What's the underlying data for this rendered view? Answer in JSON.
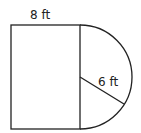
{
  "figure": {
    "labels": {
      "top_width": "8 ft",
      "radius": "6 ft"
    },
    "shapes": {
      "rectangle": {
        "x": 11,
        "y": 25,
        "width": 69,
        "height": 104
      },
      "semicircle": {
        "center": [
          80,
          77
        ],
        "radius": 52,
        "side": "right"
      },
      "radius_segment": {
        "from": [
          80,
          77
        ],
        "to": [
          124,
          104
        ]
      }
    },
    "colors": {
      "stroke": "#222222",
      "background": "#ffffff"
    }
  }
}
